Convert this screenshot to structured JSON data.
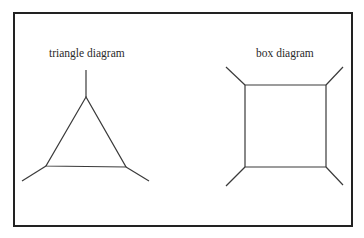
{
  "frame": {
    "x": 14,
    "y": 13,
    "width": 338,
    "height": 213,
    "stroke": "#222222",
    "stroke_width": 2
  },
  "line_color": "#3a3a3a",
  "diagrams": [
    {
      "name": "triangle",
      "label": "triangle diagram",
      "label_pos": {
        "x": 49,
        "y": 48
      },
      "vertices": [
        [
          86,
          97
        ],
        [
          46,
          166
        ],
        [
          126,
          167
        ]
      ],
      "legs": [
        [
          [
            86,
            97
          ],
          [
            86,
            70
          ]
        ],
        [
          [
            46,
            166
          ],
          [
            22,
            181
          ]
        ],
        [
          [
            126,
            167
          ],
          [
            149,
            181
          ]
        ]
      ]
    },
    {
      "name": "box",
      "label": "box diagram",
      "label_pos": {
        "x": 256,
        "y": 48
      },
      "vertices": [
        [
          245,
          85
        ],
        [
          326,
          85
        ],
        [
          326,
          167
        ],
        [
          245,
          167
        ]
      ],
      "legs": [
        [
          [
            245,
            85
          ],
          [
            226,
            67
          ]
        ],
        [
          [
            326,
            85
          ],
          [
            343,
            67
          ]
        ],
        [
          [
            245,
            167
          ],
          [
            226,
            186
          ]
        ],
        [
          [
            326,
            167
          ],
          [
            343,
            185
          ]
        ]
      ]
    }
  ]
}
